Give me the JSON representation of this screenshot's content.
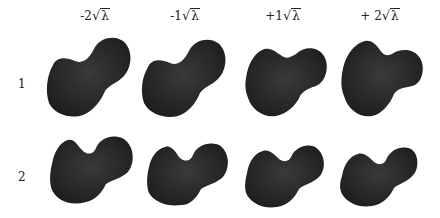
{
  "figure": {
    "column_labels": [
      {
        "coef": "-2",
        "radicand": "λ"
      },
      {
        "coef": "-1",
        "radicand": "λ"
      },
      {
        "coef": "+1",
        "radicand": "λ"
      },
      {
        "coef": "+ 2",
        "radicand": "λ"
      }
    ],
    "row_labels": [
      "1",
      "2"
    ],
    "shape_color": "#2a2a2c",
    "shape_description": "dark rendered 3D bone surface (ball head with neck and body), shape mode variations"
  }
}
